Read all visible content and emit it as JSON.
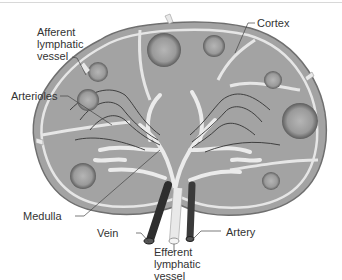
{
  "labels": {
    "afferent": "Afferent\nlymphatic\nvessel",
    "cortex": "Cortex",
    "arterioles": "Arterioles",
    "medulla": "Medulla",
    "vein": "Vein",
    "efferent": "Efferent\nlymphatic\nvessel",
    "artery": "Artery"
  },
  "colors": {
    "capsule": "#c9c9c9",
    "tissue": "#9d9d9d",
    "sinus": "#e8e8e8",
    "follicle": "#8a8a8a",
    "vessel_dark": "#3a3a3a",
    "lymph_vessel": "#ececec",
    "text": "#333333"
  }
}
